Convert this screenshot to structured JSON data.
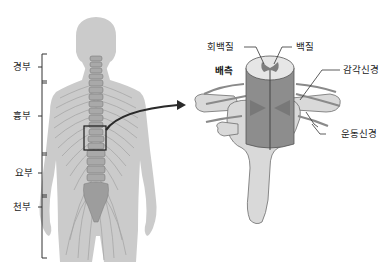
{
  "figure": {
    "left_panel": {
      "description": "back view of human body with spinal column and nerves",
      "regions": [
        {
          "label": "경부"
        },
        {
          "label": "흉부"
        },
        {
          "label": "요부"
        },
        {
          "label": "천부"
        }
      ]
    },
    "right_panel": {
      "description": "enlarged cross-section of spinal cord within vertebra",
      "labels": {
        "gray_matter": "회백질",
        "white_matter": "백질",
        "dorsal": "배측",
        "sensory_nerve": "감각신경",
        "motor_nerve": "운동신경"
      }
    },
    "colors": {
      "body": "#c9c9c9",
      "nerve": "#9a9a9a",
      "vertebra": "#d6d6d6",
      "spinal_cord": "#8f8f8f",
      "outline": "#6a6a6a",
      "arrow": "#333333"
    }
  }
}
